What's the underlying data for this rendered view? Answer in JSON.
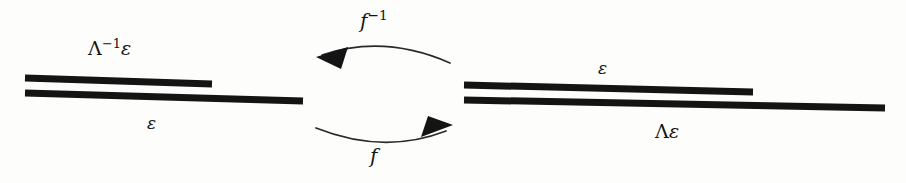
{
  "figure": {
    "name": "scaling-correspondence-diagram",
    "background_color": "#fdfdfc",
    "ink_color": "#141414",
    "arc_color": "#2a2a2a"
  },
  "labels": {
    "left_upper": "Λ⁻¹ε",
    "left_upper_base": "Λ",
    "left_upper_exponent": "−1",
    "left_upper_suffix": "ε",
    "left_lower": "ε",
    "right_upper": "ε",
    "right_lower": "Λε",
    "right_lower_base": "Λ",
    "right_lower_suffix": "ε",
    "arrow_top": "f⁻¹",
    "arrow_top_base": "f",
    "arrow_top_exponent": "−1",
    "arrow_bottom": "f"
  },
  "bars": {
    "left": [
      {
        "name": "left-upper-bar",
        "x1": 25,
        "y1": 78,
        "x2": 212,
        "y2": 84,
        "thickness": 7
      },
      {
        "name": "left-lower-bar",
        "x1": 25,
        "y1": 93,
        "x2": 303,
        "y2": 101,
        "thickness": 7
      }
    ],
    "right": [
      {
        "name": "right-upper-bar",
        "x1": 464,
        "y1": 85,
        "x2": 753,
        "y2": 92,
        "thickness": 7
      },
      {
        "name": "right-lower-bar",
        "x1": 464,
        "y1": 100,
        "x2": 885,
        "y2": 108,
        "thickness": 7
      }
    ]
  },
  "arrows": {
    "top": {
      "name": "arrow-f-inverse",
      "direction": "right-to-left",
      "path": "M 450 63 Q 384 34 322 55",
      "head_tip": [
        316,
        57
      ],
      "head_points": "316,57 347,48 340,68"
    },
    "bottom": {
      "name": "arrow-f",
      "direction": "left-to-right",
      "path": "M 316 128 Q 384 155 446 130",
      "head_tip": [
        453,
        126
      ],
      "head_points": "453,126 423,137 429,118"
    }
  }
}
